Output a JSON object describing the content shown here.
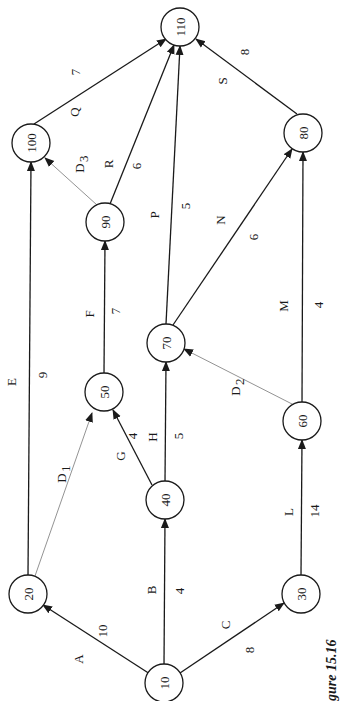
{
  "diagram": {
    "type": "network-activity-on-arrow",
    "caption": "gure 15.16",
    "nodes": [
      {
        "id": "10",
        "label": "10",
        "x": 164,
        "y": 683
      },
      {
        "id": "20",
        "label": "20",
        "x": 28,
        "y": 594
      },
      {
        "id": "30",
        "label": "30",
        "x": 301,
        "y": 594
      },
      {
        "id": "40",
        "label": "40",
        "x": 165,
        "y": 500
      },
      {
        "id": "50",
        "label": "50",
        "x": 104,
        "y": 392
      },
      {
        "id": "60",
        "label": "60",
        "x": 302,
        "y": 421
      },
      {
        "id": "70",
        "label": "70",
        "x": 166,
        "y": 343
      },
      {
        "id": "80",
        "label": "80",
        "x": 303,
        "y": 133
      },
      {
        "id": "90",
        "label": "90",
        "x": 105,
        "y": 222
      },
      {
        "id": "100",
        "label": "100",
        "x": 31,
        "y": 143
      },
      {
        "id": "110",
        "label": "110",
        "x": 180,
        "y": 27
      }
    ],
    "edges": [
      {
        "activity": "A",
        "from": "10",
        "to": "20",
        "duration": "10",
        "dummy": false
      },
      {
        "activity": "B",
        "from": "10",
        "to": "40",
        "duration": "4",
        "dummy": false
      },
      {
        "activity": "C",
        "from": "10",
        "to": "30",
        "duration": "8",
        "dummy": false
      },
      {
        "activity": "D1",
        "from": "20",
        "to": "50",
        "duration": "",
        "dummy": true
      },
      {
        "activity": "E",
        "from": "20",
        "to": "100",
        "duration": "9",
        "dummy": false
      },
      {
        "activity": "F",
        "from": "50",
        "to": "90",
        "duration": "7",
        "dummy": false
      },
      {
        "activity": "G",
        "from": "40",
        "to": "50",
        "duration": "4",
        "dummy": false
      },
      {
        "activity": "H",
        "from": "40",
        "to": "70",
        "duration": "5",
        "dummy": false
      },
      {
        "activity": "L",
        "from": "30",
        "to": "60",
        "duration": "14",
        "dummy": false
      },
      {
        "activity": "D2",
        "from": "60",
        "to": "70",
        "duration": "",
        "dummy": true
      },
      {
        "activity": "M",
        "from": "60",
        "to": "80",
        "duration": "4",
        "dummy": false
      },
      {
        "activity": "N",
        "from": "70",
        "to": "80",
        "duration": "6",
        "dummy": false
      },
      {
        "activity": "P",
        "from": "70",
        "to": "110",
        "duration": "5",
        "dummy": false
      },
      {
        "activity": "D3",
        "from": "90",
        "to": "100",
        "duration": "",
        "dummy": true
      },
      {
        "activity": "R",
        "from": "90",
        "to": "110",
        "duration": "6",
        "dummy": false
      },
      {
        "activity": "Q",
        "from": "100",
        "to": "110",
        "duration": "7",
        "dummy": false
      },
      {
        "activity": "S",
        "from": "80",
        "to": "110",
        "duration": "8",
        "dummy": false
      }
    ],
    "labels": {
      "A": "A",
      "A_dur": "10",
      "B": "B",
      "B_dur": "4",
      "C": "C",
      "C_dur": "8",
      "D1": "D",
      "D1_sub": "1",
      "E": "E",
      "E_dur": "9",
      "F": "F",
      "F_dur": "7",
      "G": "G",
      "G_dur": "4",
      "H": "H",
      "H_dur": "5",
      "L": "L",
      "L_dur": "14",
      "D2": "D",
      "D2_sub": "2",
      "M": "M",
      "M_dur": "4",
      "N": "N",
      "N_dur": "6",
      "P": "P",
      "P_dur": "5",
      "D3": "D",
      "D3_sub": "3",
      "R": "R",
      "R_dur": "6",
      "Q": "Q",
      "Q_dur": "7",
      "S": "S",
      "S_dur": "8"
    }
  }
}
